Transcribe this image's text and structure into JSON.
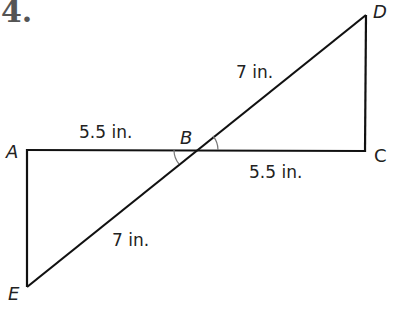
{
  "problem": {
    "number": "4."
  },
  "diagram": {
    "vertices": {
      "A": {
        "label": "A",
        "x": 27,
        "y": 150
      },
      "B": {
        "label": "B",
        "x": 196,
        "y": 150
      },
      "C": {
        "label": "C",
        "x": 365,
        "y": 151
      },
      "D": {
        "label": "D",
        "x": 366,
        "y": 15
      },
      "E": {
        "label": "E",
        "x": 27,
        "y": 287
      }
    },
    "measurements": {
      "AB": "5.5 in.",
      "BC": "5.5 in.",
      "BD": "7 in.",
      "EB": "7 in."
    },
    "colors": {
      "stroke": "#111111",
      "arc": "#777777",
      "text": "#222222"
    }
  }
}
